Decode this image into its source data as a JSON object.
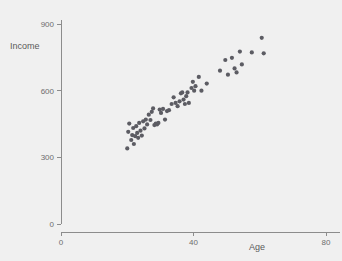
{
  "chart_data": {
    "type": "scatter",
    "title": "",
    "xlabel": "Age",
    "ylabel": "Income",
    "xlim": [
      0,
      85
    ],
    "ylim": [
      0,
      960
    ],
    "xticks": [
      0,
      40,
      80
    ],
    "xticklabels": [
      "0",
      "40",
      "80"
    ],
    "yticks": [
      0,
      300,
      600,
      900
    ],
    "yticklabels": [
      "0",
      "300",
      "600",
      "900"
    ],
    "grid": false,
    "legend": null,
    "marker": {
      "shape": "circle",
      "color": "#5c5c63",
      "size_px": 2.1
    },
    "background_color": "#f0f0f0",
    "axis_color": "#8c8c8c",
    "points": [
      {
        "x": 20.0,
        "y": 340
      },
      {
        "x": 20.3,
        "y": 415
      },
      {
        "x": 20.6,
        "y": 452
      },
      {
        "x": 21.2,
        "y": 378
      },
      {
        "x": 21.5,
        "y": 400
      },
      {
        "x": 21.8,
        "y": 432
      },
      {
        "x": 22.0,
        "y": 360
      },
      {
        "x": 22.4,
        "y": 395
      },
      {
        "x": 22.7,
        "y": 440
      },
      {
        "x": 23.0,
        "y": 410
      },
      {
        "x": 23.3,
        "y": 388
      },
      {
        "x": 23.6,
        "y": 455
      },
      {
        "x": 24.0,
        "y": 420
      },
      {
        "x": 24.4,
        "y": 398
      },
      {
        "x": 24.8,
        "y": 462
      },
      {
        "x": 25.2,
        "y": 430
      },
      {
        "x": 25.6,
        "y": 470
      },
      {
        "x": 26.0,
        "y": 448
      },
      {
        "x": 26.5,
        "y": 492
      },
      {
        "x": 27.0,
        "y": 468
      },
      {
        "x": 27.4,
        "y": 505
      },
      {
        "x": 27.8,
        "y": 520
      },
      {
        "x": 28.2,
        "y": 445
      },
      {
        "x": 28.6,
        "y": 452
      },
      {
        "x": 29.0,
        "y": 448
      },
      {
        "x": 29.4,
        "y": 455
      },
      {
        "x": 29.8,
        "y": 515
      },
      {
        "x": 30.2,
        "y": 500
      },
      {
        "x": 30.8,
        "y": 518
      },
      {
        "x": 31.4,
        "y": 470
      },
      {
        "x": 32.0,
        "y": 508
      },
      {
        "x": 32.6,
        "y": 512
      },
      {
        "x": 33.4,
        "y": 540
      },
      {
        "x": 34.0,
        "y": 570
      },
      {
        "x": 34.6,
        "y": 545
      },
      {
        "x": 35.2,
        "y": 530
      },
      {
        "x": 35.8,
        "y": 552
      },
      {
        "x": 36.2,
        "y": 588
      },
      {
        "x": 36.6,
        "y": 592
      },
      {
        "x": 37.0,
        "y": 560
      },
      {
        "x": 37.4,
        "y": 540
      },
      {
        "x": 37.8,
        "y": 575
      },
      {
        "x": 38.2,
        "y": 592
      },
      {
        "x": 38.6,
        "y": 545
      },
      {
        "x": 39.4,
        "y": 612
      },
      {
        "x": 39.8,
        "y": 640
      },
      {
        "x": 40.2,
        "y": 600
      },
      {
        "x": 40.6,
        "y": 620
      },
      {
        "x": 41.6,
        "y": 662
      },
      {
        "x": 42.4,
        "y": 600
      },
      {
        "x": 44.0,
        "y": 632
      },
      {
        "x": 48.0,
        "y": 690
      },
      {
        "x": 49.6,
        "y": 738
      },
      {
        "x": 50.4,
        "y": 672
      },
      {
        "x": 51.6,
        "y": 748
      },
      {
        "x": 52.4,
        "y": 700
      },
      {
        "x": 53.0,
        "y": 682
      },
      {
        "x": 54.0,
        "y": 776
      },
      {
        "x": 54.6,
        "y": 718
      },
      {
        "x": 57.6,
        "y": 772
      },
      {
        "x": 60.6,
        "y": 838
      },
      {
        "x": 61.2,
        "y": 768
      }
    ]
  },
  "axes": {
    "y_title": "Income",
    "x_title": "Age"
  }
}
